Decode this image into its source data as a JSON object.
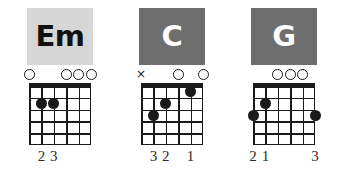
{
  "page": {
    "background": "#ffffff",
    "ink": "#1a1a1a"
  },
  "legend": {
    "open_string_symbol": "O",
    "muted_string_symbol": "×",
    "strings_count": 6,
    "frets_count": 5
  },
  "chords": [
    {
      "name": "Em",
      "plate_bg": "#d6d6d6",
      "plate_fg": "#111111",
      "markers": [
        {
          "string": 6,
          "symbol": "O",
          "type": "open"
        },
        {
          "string": 3,
          "symbol": "O",
          "type": "open"
        },
        {
          "string": 2,
          "symbol": "O",
          "type": "open"
        },
        {
          "string": 1,
          "symbol": "O",
          "type": "open"
        }
      ],
      "dots": [
        {
          "string": 5,
          "fret": 2,
          "finger": "2"
        },
        {
          "string": 4,
          "fret": 2,
          "finger": "3"
        }
      ],
      "fingers": [
        {
          "string": 5,
          "label": "2"
        },
        {
          "string": 4,
          "label": "3"
        }
      ]
    },
    {
      "name": "C",
      "plate_bg": "#6e6e6e",
      "plate_fg": "#ffffff",
      "markers": [
        {
          "string": 6,
          "symbol": "×",
          "type": "muted"
        },
        {
          "string": 3,
          "symbol": "O",
          "type": "open"
        },
        {
          "string": 1,
          "symbol": "O",
          "type": "open"
        }
      ],
      "dots": [
        {
          "string": 5,
          "fret": 3,
          "finger": "3"
        },
        {
          "string": 4,
          "fret": 2,
          "finger": "2"
        },
        {
          "string": 2,
          "fret": 1,
          "finger": "1"
        }
      ],
      "fingers": [
        {
          "string": 5,
          "label": "3"
        },
        {
          "string": 4,
          "label": "2"
        },
        {
          "string": 2,
          "label": "1"
        }
      ]
    },
    {
      "name": "G",
      "plate_bg": "#6e6e6e",
      "plate_fg": "#ffffff",
      "markers": [
        {
          "string": 4,
          "symbol": "O",
          "type": "open"
        },
        {
          "string": 3,
          "symbol": "O",
          "type": "open"
        },
        {
          "string": 2,
          "symbol": "O",
          "type": "open"
        }
      ],
      "dots": [
        {
          "string": 6,
          "fret": 3,
          "finger": "2"
        },
        {
          "string": 5,
          "fret": 2,
          "finger": "1"
        },
        {
          "string": 1,
          "fret": 3,
          "finger": "3"
        }
      ],
      "fingers": [
        {
          "string": 6,
          "label": "2"
        },
        {
          "string": 5,
          "label": "1"
        },
        {
          "string": 1,
          "label": "3"
        }
      ]
    }
  ]
}
